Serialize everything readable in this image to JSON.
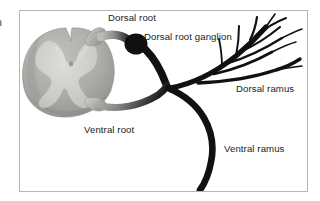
{
  "figure": {
    "edge_text_fragment": "n",
    "frame": {
      "x": 19,
      "y": 10,
      "width": 289,
      "height": 182,
      "border_color": "#b6b6b6",
      "background_color": "#ffffff"
    },
    "colors": {
      "white_matter": "#a9a9a5",
      "white_matter_shadow": "#8f8f8b",
      "gray_matter": "#c9c9c5",
      "gray_matter_light": "#d6d6d2",
      "root_stalk": "#b4b4b0",
      "nerve_black": "#111111",
      "label_text": "#1c1c1c"
    },
    "labels": [
      {
        "id": "dorsal-root",
        "text": "Dorsal root",
        "x": 108,
        "y": 13
      },
      {
        "id": "dorsal-root-ganglion",
        "text": "Dorsal root ganglion",
        "x": 144,
        "y": 32
      },
      {
        "id": "dorsal-ramus",
        "text": "Dorsal ramus",
        "x": 236,
        "y": 84
      },
      {
        "id": "ventral-root",
        "text": "Ventral root",
        "x": 84,
        "y": 125
      },
      {
        "id": "ventral-ramus",
        "text": "Ventral ramus",
        "x": 224,
        "y": 144
      }
    ],
    "structures": [
      {
        "id": "spinal-cord-cross-section",
        "kind": "spinal-cord",
        "cx": 72,
        "cy": 70
      },
      {
        "id": "gray-matter-butterfly",
        "kind": "gray-matter",
        "cx": 70,
        "cy": 68
      },
      {
        "id": "central-canal",
        "kind": "central-canal",
        "cx": 71,
        "cy": 64
      },
      {
        "id": "dorsal-root-stalk",
        "kind": "root",
        "cx": 101,
        "cy": 38
      },
      {
        "id": "dorsal-root-ganglion-body",
        "kind": "ganglion",
        "cx": 136,
        "cy": 44
      },
      {
        "id": "ventral-root-stalk",
        "kind": "root",
        "cx": 104,
        "cy": 106
      },
      {
        "id": "spinal-nerve-junction",
        "kind": "junction",
        "cx": 170,
        "cy": 95
      },
      {
        "id": "dorsal-ramus-branches",
        "kind": "nerve-tree",
        "cx": 252,
        "cy": 50
      },
      {
        "id": "ventral-ramus-trunk",
        "kind": "nerve-trunk",
        "cx": 210,
        "cy": 150
      }
    ]
  }
}
